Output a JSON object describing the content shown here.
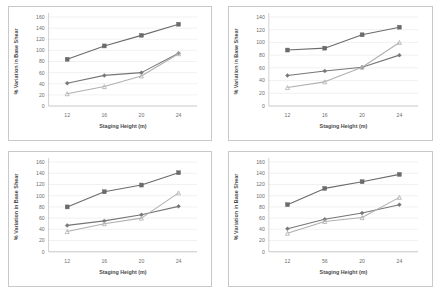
{
  "figure": {
    "background": "#ffffff",
    "panel_border_color": "#c9c9c9",
    "gridline_color": "#e2e2e2",
    "axis_color": "#b4b4b4",
    "tick_label_color": "#6e6e6e",
    "axis_title_color": "#4a4a4a"
  },
  "series_style": [
    {
      "name": "series-1",
      "color": "#6b6b6b",
      "marker": "square"
    },
    {
      "name": "series-2",
      "color": "#767676",
      "marker": "diamond"
    },
    {
      "name": "series-3",
      "color": "#b0b0b0",
      "marker": "triangle"
    }
  ],
  "chart_data": [
    {
      "id": "chart-top-left",
      "type": "line",
      "title": "",
      "xlabel": "Staging Height (m)",
      "ylabel": "% Variation in Base Shear",
      "categories": [
        12,
        16,
        20,
        24
      ],
      "xticklabels": [
        "12",
        "16",
        "20",
        "24"
      ],
      "yticks": [
        0,
        20,
        40,
        60,
        80,
        100,
        120,
        140,
        160
      ],
      "yticklabels": [
        "0",
        "20",
        "40",
        "60",
        "80",
        "100",
        "120",
        "140",
        "160"
      ],
      "ylim": [
        0,
        160
      ],
      "grid": true,
      "legend": "none",
      "series": [
        {
          "name": "series-1",
          "values": [
            84,
            108,
            127,
            147
          ]
        },
        {
          "name": "series-2",
          "values": [
            41,
            55,
            60,
            95
          ]
        },
        {
          "name": "series-3",
          "values": [
            22,
            35,
            54,
            94
          ]
        }
      ]
    },
    {
      "id": "chart-top-right",
      "type": "line",
      "title": "",
      "xlabel": "Staging Height (m)",
      "ylabel": "% Variation in Base Shear",
      "categories": [
        12,
        16,
        20,
        24
      ],
      "xticklabels": [
        "12",
        "16",
        "20",
        "24"
      ],
      "yticks": [
        0,
        20,
        40,
        60,
        80,
        100,
        120,
        140
      ],
      "yticklabels": [
        "0",
        "20",
        "40",
        "60",
        "80",
        "100",
        "120",
        "140"
      ],
      "ylim": [
        0,
        140
      ],
      "grid": true,
      "legend": "none",
      "series": [
        {
          "name": "series-1",
          "values": [
            88,
            91,
            112,
            124
          ]
        },
        {
          "name": "series-2",
          "values": [
            48,
            55,
            61,
            80
          ]
        },
        {
          "name": "series-3",
          "values": [
            29,
            38,
            61,
            100
          ]
        }
      ]
    },
    {
      "id": "chart-bottom-left",
      "type": "line",
      "title": "",
      "xlabel": "Staging Height (m)",
      "ylabel": "% Variation in Base Shear",
      "categories": [
        12,
        16,
        20,
        24
      ],
      "xticklabels": [
        "12",
        "16",
        "20",
        "24"
      ],
      "yticks": [
        0,
        20,
        40,
        60,
        80,
        100,
        120,
        140,
        160
      ],
      "yticklabels": [
        "0",
        "20",
        "40",
        "60",
        "80",
        "100",
        "120",
        "140",
        "160"
      ],
      "ylim": [
        0,
        160
      ],
      "grid": true,
      "legend": "none",
      "series": [
        {
          "name": "series-1",
          "values": [
            80,
            107,
            119,
            141
          ]
        },
        {
          "name": "series-2",
          "values": [
            47,
            55,
            66,
            81
          ]
        },
        {
          "name": "series-3",
          "values": [
            36,
            50,
            60,
            105
          ]
        }
      ]
    },
    {
      "id": "chart-bottom-right",
      "type": "line",
      "title": "",
      "xlabel": "Staging Height (m)",
      "ylabel": "% Variation in Base Shear",
      "categories": [
        12,
        16,
        20,
        24
      ],
      "xticklabels": [
        "12",
        "56",
        "20",
        "24"
      ],
      "yticks": [
        0,
        20,
        40,
        60,
        80,
        100,
        120,
        140,
        160
      ],
      "yticklabels": [
        "0",
        "20",
        "40",
        "60",
        "80",
        "100",
        "120",
        "140",
        "160"
      ],
      "ylim": [
        0,
        160
      ],
      "grid": true,
      "legend": "none",
      "series": [
        {
          "name": "series-1",
          "values": [
            84,
            113,
            125,
            138
          ]
        },
        {
          "name": "series-2",
          "values": [
            41,
            58,
            69,
            84
          ]
        },
        {
          "name": "series-3",
          "values": [
            33,
            54,
            61,
            97
          ]
        }
      ]
    }
  ]
}
